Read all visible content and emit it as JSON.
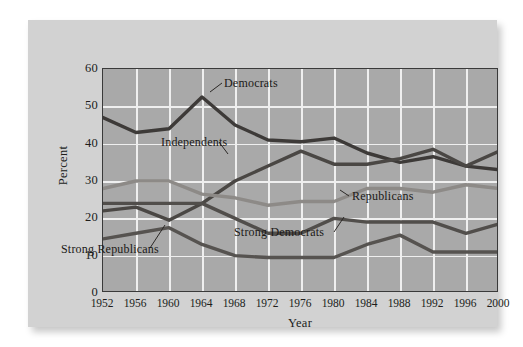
{
  "chart_data": {
    "type": "line",
    "title": "",
    "xlabel": "Year",
    "ylabel": "Percent",
    "xlim": [
      1952,
      2000
    ],
    "ylim": [
      0,
      60
    ],
    "grid": true,
    "legend_position": "inline-annotations",
    "categories": [
      1952,
      1956,
      1960,
      1964,
      1968,
      1972,
      1976,
      1980,
      1984,
      1988,
      1992,
      1996,
      2000
    ],
    "x_tick_labels": [
      "1952",
      "1956",
      "1960",
      "1964",
      "1968",
      "1972",
      "1976",
      "1980",
      "1984",
      "1988",
      "1992",
      "1996",
      "2000"
    ],
    "y_tick_labels": [
      "0",
      "10",
      "20",
      "30",
      "40",
      "50",
      "60"
    ],
    "y_ticks": [
      0,
      10,
      20,
      30,
      40,
      50,
      60
    ],
    "series": [
      {
        "name": "Democrats",
        "color": "#3d3a38",
        "values": [
          47,
          43,
          44,
          52.5,
          45,
          41,
          40.5,
          41.5,
          37.5,
          35,
          36.5,
          34,
          33
        ]
      },
      {
        "name": "Independents",
        "color": "#4a4744",
        "values": [
          22,
          23,
          19.5,
          24,
          30,
          34,
          38,
          34.5,
          34.5,
          36,
          38.5,
          34,
          38
        ]
      },
      {
        "name": "Republicans",
        "color": "#8d8a87",
        "values": [
          28,
          30,
          30,
          26.5,
          25.5,
          23.5,
          24.5,
          24.5,
          28,
          28,
          27,
          29,
          28
        ]
      },
      {
        "name": "Strong Democrats",
        "color": "#514e4b",
        "values": [
          24,
          24,
          24,
          24,
          20,
          16,
          16,
          20,
          19,
          19,
          19,
          16,
          18.5
        ]
      },
      {
        "name": "Strong Republicans",
        "color": "#565350",
        "values": [
          14.5,
          16,
          17.5,
          13,
          10,
          9.5,
          9.5,
          9.5,
          13,
          15.5,
          11,
          11,
          11
        ]
      }
    ],
    "annotations": [
      {
        "text": "Democrats",
        "near_year": 1968,
        "near_value": 53
      },
      {
        "text": "Independents",
        "near_year": 1964,
        "near_value": 38
      },
      {
        "text": "Republicans",
        "near_year": 1988,
        "near_value": 25
      },
      {
        "text": "Strong Democrats",
        "near_year": 1980,
        "near_value": 14
      },
      {
        "text": "Strong Republicans",
        "near_year": 1956,
        "near_value": 9
      }
    ],
    "colors": {
      "plot_background": "#a9a9a9",
      "card_background": "#d2d2d2",
      "gridline": "#efefef",
      "axis": "#3a3a3a",
      "text": "#201d1b"
    }
  }
}
